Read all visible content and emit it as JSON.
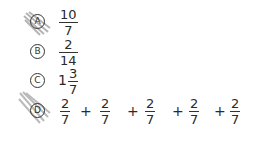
{
  "choices": [
    {
      "letter": "A",
      "marked": true,
      "expression": {
        "numerator": "10",
        "denominator": "7"
      }
    },
    {
      "letter": "B",
      "marked": false,
      "expression": {
        "numerator": "2",
        "denominator": "14"
      }
    },
    {
      "letter": "C",
      "marked": false,
      "expression": {
        "whole": "1",
        "numerator": "3",
        "denominator": "7"
      }
    },
    {
      "letter": "D",
      "marked": true,
      "expression": {
        "terms": [
          {
            "numerator": "2",
            "denominator": "7"
          },
          {
            "numerator": "2",
            "denominator": "7"
          },
          {
            "numerator": "2",
            "denominator": "7"
          },
          {
            "numerator": "2",
            "denominator": "7"
          },
          {
            "numerator": "2",
            "denominator": "7"
          }
        ],
        "operator": "+"
      }
    }
  ],
  "colors": {
    "ink": "#333333",
    "pencil": "#7a7a7a"
  }
}
